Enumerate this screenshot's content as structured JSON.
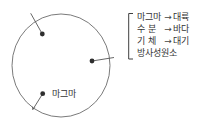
{
  "figure": {
    "description_labels": {
      "dot_label": "마그마"
    },
    "bracket_items": [
      {
        "term": "마그마",
        "arrow": "→",
        "result": "대륙"
      },
      {
        "term": "수 분",
        "arrow": "→",
        "result": "바다"
      },
      {
        "term": "기 체",
        "arrow": "→",
        "result": "대기"
      },
      {
        "term": "방사성원소",
        "arrow": "",
        "result": ""
      }
    ],
    "colors": {
      "circle_stroke": "#6b6b6b",
      "leader_stroke": "#555555",
      "dot_fill": "#2e2e2e",
      "bracket_stroke": "#3f3f3f",
      "text_ink": "#333333",
      "background": "#ffffff"
    }
  }
}
